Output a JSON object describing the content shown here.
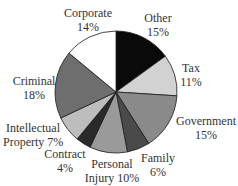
{
  "chart_data": {
    "type": "pie",
    "title": "",
    "start_angle_deg": 0,
    "direction": "clockwise",
    "slices": [
      {
        "label": "Other",
        "value": 15,
        "color": "#0a0a0a"
      },
      {
        "label": "Tax",
        "value": 11,
        "color": "#d2d2d2"
      },
      {
        "label": "Government",
        "value": 15,
        "color": "#8a8a8a"
      },
      {
        "label": "Family",
        "value": 6,
        "color": "#4a4a4a"
      },
      {
        "label": "Personal Injury",
        "value": 10,
        "color": "#9a9a9a"
      },
      {
        "label": "Contract",
        "value": 4,
        "color": "#2a2a2a"
      },
      {
        "label": "Intellectual Property",
        "value": 7,
        "color": "#bdbdbd"
      },
      {
        "label": "Criminal",
        "value": 18,
        "color": "#6e6e6e"
      },
      {
        "label": "Corporate",
        "value": 14,
        "color": "#ffffff"
      }
    ]
  },
  "labels": {
    "other": {
      "name": "Other",
      "pct": "15%"
    },
    "tax": {
      "name": "Tax",
      "pct": "11%"
    },
    "government": {
      "name": "Government",
      "pct": "15%"
    },
    "family": {
      "name": "Family",
      "pct": "6%"
    },
    "personal_injury": {
      "line1": "Personal",
      "line2": "Injury 10%"
    },
    "contract": {
      "name": "Contract",
      "pct": "4%"
    },
    "intellectual_property": {
      "line1": "Intellectual",
      "line2": "Property 7%"
    },
    "criminal": {
      "name": "Criminal",
      "pct": "18%"
    },
    "corporate": {
      "name": "Corporate",
      "pct": "14%"
    }
  }
}
